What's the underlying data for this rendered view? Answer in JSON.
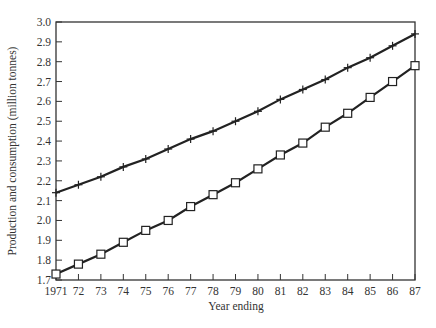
{
  "chart_data": {
    "type": "line",
    "title": "",
    "xlabel": "Year ending",
    "ylabel": "Production and consumption (million tonnes)",
    "categories": [
      "1971",
      "72",
      "73",
      "74",
      "75",
      "76",
      "77",
      "78",
      "79",
      "80",
      "81",
      "82",
      "83",
      "84",
      "85",
      "86",
      "87"
    ],
    "x": [
      1971,
      1972,
      1973,
      1974,
      1975,
      1976,
      1977,
      1978,
      1979,
      1980,
      1981,
      1982,
      1983,
      1984,
      1985,
      1986,
      1987
    ],
    "ylim": [
      1.7,
      3.0
    ],
    "yticks": [
      "1.7",
      "1.8",
      "1.9",
      "2.0",
      "2.1",
      "2.2",
      "2.3",
      "2.4",
      "2.5",
      "2.6",
      "2.7",
      "2.8",
      "2.9",
      "3.0"
    ],
    "grid": false,
    "legend": null,
    "series": [
      {
        "name": "plus-marker series",
        "marker": "+",
        "values": [
          2.14,
          2.18,
          2.22,
          2.27,
          2.31,
          2.36,
          2.41,
          2.45,
          2.5,
          2.55,
          2.61,
          2.66,
          2.71,
          2.77,
          2.82,
          2.88,
          2.94
        ]
      },
      {
        "name": "square-marker series",
        "marker": "square",
        "values": [
          1.73,
          1.78,
          1.83,
          1.89,
          1.95,
          2.0,
          2.07,
          2.13,
          2.19,
          2.26,
          2.33,
          2.39,
          2.47,
          2.54,
          2.62,
          2.7,
          2.78
        ]
      }
    ]
  }
}
